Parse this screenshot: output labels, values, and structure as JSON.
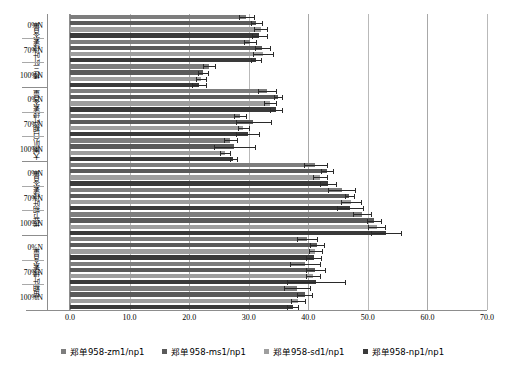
{
  "chart_data": {
    "type": "bar",
    "orientation": "horizontal",
    "title": "",
    "xlabel": "",
    "ylabel": "",
    "xlim": [
      0.0,
      70.0
    ],
    "xticks": [
      "0.0",
      "10.0",
      "20.0",
      "30.0",
      "40.0",
      "50.0",
      "60.0",
      "70.0"
    ],
    "xtick_values": [
      0,
      10,
      20,
      30,
      40,
      50,
      60,
      70
    ],
    "grid": true,
    "grid_axis": "x",
    "legend_position": "bottom",
    "series": [
      {
        "name": "郑单958-zm1/np1",
        "color": "#7d7d7d"
      },
      {
        "name": "郑单958-ms1/np1",
        "color": "#5a5a5a"
      },
      {
        "name": "郑单958-sd1/np1",
        "color": "#9e9e9e"
      },
      {
        "name": "郑单958-np1/np1",
        "color": "#3a3a3a"
      }
    ],
    "groups": [
      {
        "label": "棒三叶叶绿素含量",
        "levels": [
          {
            "label": "0%N",
            "values": [
              29.6,
              31.3,
              32.0,
              31.8
            ],
            "errors": [
              1.3,
              1.0,
              1.1,
              1.2
            ]
          },
          {
            "label": "70%N",
            "values": [
              30.2,
              32.3,
              32.4,
              31.2
            ],
            "errors": [
              1.0,
              1.2,
              1.6,
              0.9
            ]
          },
          {
            "label": "100%N",
            "values": [
              23.4,
              22.3,
              22.0,
              21.7
            ],
            "errors": [
              1.0,
              0.8,
              0.9,
              1.2
            ]
          }
        ]
      },
      {
        "label": "大喇叭口期叶绿素含量",
        "levels": [
          {
            "label": "0%N",
            "values": [
              33.0,
              34.9,
              33.5,
              34.6
            ],
            "errors": [
              1.5,
              0.7,
              1.0,
              1.0
            ]
          },
          {
            "label": "70%N",
            "values": [
              28.5,
              30.8,
              29.1,
              29.8
            ],
            "errors": [
              1.0,
              3.0,
              0.9,
              2.0
            ]
          },
          {
            "label": "100%N",
            "values": [
              26.9,
              27.6,
              26.0,
              27.4
            ],
            "errors": [
              1.1,
              3.5,
              0.8,
              0.6
            ]
          }
        ]
      },
      {
        "label": "拔节期叶绿素含量",
        "levels": [
          {
            "label": "0%N",
            "values": [
              41.2,
              43.2,
              42.0,
              43.3
            ],
            "errors": [
              2.0,
              1.0,
              1.2,
              1.3
            ]
          },
          {
            "label": "70%N",
            "values": [
              45.6,
              46.9,
              47.2,
              47.0
            ],
            "errors": [
              2.3,
              0.8,
              1.7,
              2.2
            ]
          },
          {
            "label": "100%N",
            "values": [
              49.0,
              51.0,
              51.5,
              53.0
            ],
            "errors": [
              1.5,
              1.2,
              1.4,
              2.5
            ]
          }
        ]
      },
      {
        "label": "苗期叶绿素含量",
        "levels": [
          {
            "label": "0%N",
            "values": [
              39.8,
              41.5,
              41.2,
              40.9
            ],
            "errors": [
              1.7,
              1.2,
              1.1,
              1.2
            ]
          },
          {
            "label": "70%N",
            "values": [
              39.5,
              41.2,
              40.8,
              41.3
            ],
            "errors": [
              2.5,
              1.6,
              1.2,
              4.8
            ]
          },
          {
            "label": "100%N",
            "values": [
              38.1,
              39.4,
              38.3,
              37.4
            ],
            "errors": [
              2.2,
              1.3,
              1.2,
              0.9
            ]
          }
        ]
      }
    ]
  }
}
